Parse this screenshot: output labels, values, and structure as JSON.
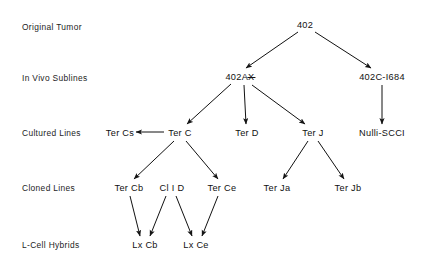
{
  "figure": {
    "type": "lineage-tree-diagram",
    "background": "#ffffff",
    "ink": "#111111",
    "width": 423,
    "height": 267
  },
  "row_labels": [
    {
      "id": "original-tumor",
      "text": "Original  Tumor",
      "x": 22,
      "y": 27
    },
    {
      "id": "in-vivo-sublines",
      "text": "In Vivo Sublines",
      "x": 22,
      "y": 78
    },
    {
      "id": "cultured-lines",
      "text": "Cultured  Lines",
      "x": 22,
      "y": 133
    },
    {
      "id": "cloned-lines",
      "text": "Cloned  Lines",
      "x": 22,
      "y": 188
    },
    {
      "id": "l-cell-hybrids",
      "text": "L-Cell  Hybrids",
      "x": 22,
      "y": 245
    }
  ],
  "nodes": [
    {
      "id": "n402",
      "label": "402",
      "x": 305,
      "y": 25,
      "overbar": ""
    },
    {
      "id": "n402ax",
      "label": "402A",
      "x": 240,
      "y": 77,
      "overbar": "X"
    },
    {
      "id": "n402c1684",
      "label": "402C-I684",
      "x": 382,
      "y": 77,
      "overbar": ""
    },
    {
      "id": "tercs",
      "label": "Ter Cs",
      "x": 120,
      "y": 133,
      "overbar": ""
    },
    {
      "id": "terc",
      "label": "Ter C",
      "x": 180,
      "y": 133,
      "overbar": ""
    },
    {
      "id": "terd",
      "label": "Ter D",
      "x": 247,
      "y": 133,
      "overbar": ""
    },
    {
      "id": "terj",
      "label": "Ter J",
      "x": 313,
      "y": 133,
      "overbar": ""
    },
    {
      "id": "nulliscci",
      "label": "Nulli-SCCI",
      "x": 382,
      "y": 133,
      "overbar": ""
    },
    {
      "id": "tercb",
      "label": "Ter Cb",
      "x": 129,
      "y": 188,
      "overbar": ""
    },
    {
      "id": "clid",
      "label": "Cl I D",
      "x": 172,
      "y": 188,
      "overbar": ""
    },
    {
      "id": "terce",
      "label": "Ter Ce",
      "x": 222,
      "y": 188,
      "overbar": ""
    },
    {
      "id": "terja",
      "label": "Ter Ja",
      "x": 277,
      "y": 188,
      "overbar": ""
    },
    {
      "id": "terjb",
      "label": "Ter Jb",
      "x": 348,
      "y": 188,
      "overbar": ""
    },
    {
      "id": "lxcb",
      "label": "Lx Cb",
      "x": 145,
      "y": 245,
      "overbar": ""
    },
    {
      "id": "lxce",
      "label": "Lx Ce",
      "x": 196,
      "y": 245,
      "overbar": ""
    }
  ],
  "edges": [
    {
      "from": "n402",
      "to": "n402ax",
      "x1": 298,
      "y1": 32,
      "x2": 246,
      "y2": 68
    },
    {
      "from": "n402",
      "to": "n402c1684",
      "x1": 315,
      "y1": 32,
      "x2": 371,
      "y2": 68
    },
    {
      "from": "n402ax",
      "to": "terc",
      "x1": 231,
      "y1": 84,
      "x2": 187,
      "y2": 124
    },
    {
      "from": "n402ax",
      "to": "terd",
      "x1": 244,
      "y1": 85,
      "x2": 246,
      "y2": 124
    },
    {
      "from": "n402ax",
      "to": "terj",
      "x1": 252,
      "y1": 85,
      "x2": 305,
      "y2": 124
    },
    {
      "from": "n402c1684",
      "to": "nulliscci",
      "x1": 382,
      "y1": 85,
      "x2": 382,
      "y2": 124
    },
    {
      "from": "terc",
      "to": "tercs",
      "x1": 164,
      "y1": 132,
      "x2": 136,
      "y2": 132
    },
    {
      "from": "terc",
      "to": "tercb",
      "x1": 174,
      "y1": 141,
      "x2": 134,
      "y2": 179
    },
    {
      "from": "terc",
      "to": "terce",
      "x1": 186,
      "y1": 141,
      "x2": 218,
      "y2": 179
    },
    {
      "from": "terj",
      "to": "terja",
      "x1": 308,
      "y1": 141,
      "x2": 283,
      "y2": 179
    },
    {
      "from": "terj",
      "to": "terjb",
      "x1": 318,
      "y1": 141,
      "x2": 344,
      "y2": 179
    },
    {
      "from": "tercb",
      "to": "lxcb",
      "x1": 130,
      "y1": 196,
      "x2": 140,
      "y2": 236
    },
    {
      "from": "clid",
      "to": "lxcb",
      "x1": 166,
      "y1": 196,
      "x2": 150,
      "y2": 236
    },
    {
      "from": "clid",
      "to": "lxce",
      "x1": 176,
      "y1": 196,
      "x2": 192,
      "y2": 236
    },
    {
      "from": "terce",
      "to": "lxce",
      "x1": 218,
      "y1": 196,
      "x2": 202,
      "y2": 236
    }
  ]
}
